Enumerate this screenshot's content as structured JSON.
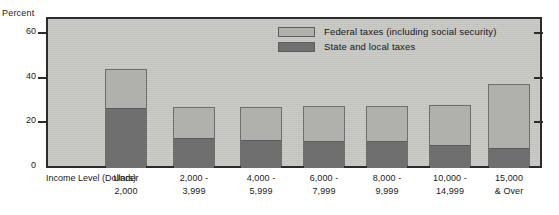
{
  "chart_data": {
    "type": "bar",
    "subtype": "stacked",
    "title": "",
    "xlabel": "Income Level (Dollars)",
    "ylabel": "Percent",
    "ylim": [
      0,
      65
    ],
    "yticks": [
      0,
      20,
      40,
      60
    ],
    "ytick_labels": [
      "0",
      "20",
      "40",
      "60"
    ],
    "grid": false,
    "legend_position": "top-center",
    "categories": [
      "Under 2,000",
      "2,000 - 3,999",
      "4,000 - 5,999",
      "6,000 - 7,999",
      "8,000 - 9,999",
      "10,000 - 14,999",
      "15,000 & Over"
    ],
    "series": [
      {
        "name": "State and local taxes",
        "color": "#6f6f6f",
        "values": [
          26.5,
          13.0,
          12.0,
          11.5,
          11.5,
          10.0,
          8.5
        ]
      },
      {
        "name": "Federal taxes (including social security)",
        "color": "#b0b0ad",
        "values": [
          17.0,
          13.5,
          14.5,
          15.5,
          15.5,
          17.5,
          28.0
        ]
      }
    ],
    "totals": [
      43.5,
      26.5,
      26.5,
      27.0,
      27.0,
      27.5,
      36.5
    ]
  },
  "axis": {
    "y_title": "Percent",
    "x_title_line1": "Income  Level",
    "x_title_line2": "(Dollars)"
  },
  "ytick_items": [
    {
      "label": "60",
      "value": 60
    },
    {
      "label": "40",
      "value": 40
    },
    {
      "label": "20",
      "value": 20
    },
    {
      "label": "0",
      "value": 0
    }
  ],
  "legend": {
    "items": [
      {
        "label": "Federal taxes (including social security)",
        "color": "#b0b0ad"
      },
      {
        "label": "State and local taxes",
        "color": "#6f6f6f"
      }
    ]
  },
  "bars": [
    {
      "label_line1": "Under",
      "label_line2": "2,000",
      "state": 26.5,
      "federal": 17.0
    },
    {
      "label_line1": "2,000 -",
      "label_line2": "3,999",
      "state": 13.0,
      "federal": 13.5
    },
    {
      "label_line1": "4,000 -",
      "label_line2": "5,999",
      "state": 12.0,
      "federal": 14.5
    },
    {
      "label_line1": "6,000 -",
      "label_line2": "7,999",
      "state": 11.5,
      "federal": 15.5
    },
    {
      "label_line1": "8,000 -",
      "label_line2": "9,999",
      "state": 11.5,
      "federal": 15.5
    },
    {
      "label_line1": "10,000 -",
      "label_line2": "14,999",
      "state": 10.0,
      "federal": 17.5
    },
    {
      "label_line1": "15,000",
      "label_line2": "& Over",
      "state": 8.5,
      "federal": 28.0
    }
  ]
}
